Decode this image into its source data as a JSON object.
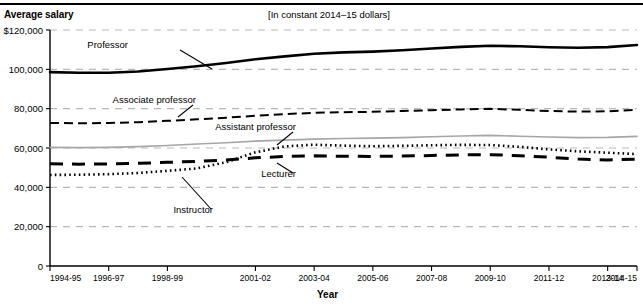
{
  "header": {
    "y_axis_title": "Average salary",
    "subtitle": "[In constant 2014–15 dollars]",
    "x_axis_title": "Year"
  },
  "chart_data": {
    "type": "line",
    "title": "Average salary",
    "subtitle": "[In constant 2014–15 dollars]",
    "xlabel": "Year",
    "ylabel": "Average salary",
    "ylim": [
      0,
      120000
    ],
    "ytick_labels": [
      "$120,000",
      "100,000",
      "80,000",
      "60,000",
      "40,000",
      "20,000",
      "0"
    ],
    "ytick_values": [
      120000,
      100000,
      80000,
      60000,
      40000,
      20000,
      0
    ],
    "grid": "horizontal-dashed",
    "legend": "inline-annotations",
    "x": [
      "1994-95",
      "1995-96",
      "1996-97",
      "1997-98",
      "1998-99",
      "1999-2000",
      "2000-01",
      "2001-02",
      "2002-03",
      "2003-04",
      "2004-05",
      "2005-06",
      "2006-07",
      "2007-08",
      "2008-09",
      "2009-10",
      "2010-11",
      "2011-12",
      "2012-13",
      "2013-14",
      "2014-15"
    ],
    "xtick_labels": [
      "1994-95",
      "1996-97",
      "1998-99",
      "2001-02",
      "2003-04",
      "2005-06",
      "2007-08",
      "2009-10",
      "2011-12",
      "2013-14",
      "2014-15"
    ],
    "xtick_indices": [
      0,
      2,
      4,
      7,
      9,
      11,
      13,
      15,
      17,
      19,
      20
    ],
    "series": [
      {
        "name": "Professor",
        "style": "solid-thick-black",
        "color": "#000000",
        "values": [
          98600,
          98300,
          98300,
          98900,
          100200,
          101600,
          103200,
          105100,
          106600,
          107900,
          108600,
          109000,
          109700,
          110600,
          111400,
          112000,
          111700,
          111200,
          111000,
          111300,
          112400
        ]
      },
      {
        "name": "Associate professor",
        "style": "dashed-black",
        "color": "#000000",
        "values": [
          72700,
          72600,
          72700,
          73100,
          73800,
          74600,
          75400,
          76400,
          77200,
          77900,
          78200,
          78400,
          78800,
          79200,
          79600,
          79900,
          79400,
          78800,
          78500,
          78700,
          79400
        ]
      },
      {
        "name": "Assistant professor",
        "style": "solid-gray",
        "color": "#a6a6a6",
        "values": [
          60300,
          60200,
          60300,
          60700,
          61300,
          62000,
          62700,
          63500,
          64000,
          64500,
          64800,
          65000,
          65300,
          65700,
          66100,
          66400,
          66000,
          65600,
          65300,
          65400,
          65900
        ]
      },
      {
        "name": "Instructor",
        "style": "dotted-black",
        "color": "#000000",
        "values": [
          46300,
          46400,
          46700,
          47300,
          48400,
          49600,
          52800,
          57800,
          60800,
          61700,
          61200,
          60900,
          61100,
          61400,
          61600,
          61500,
          60600,
          59300,
          58300,
          57600,
          56900
        ]
      },
      {
        "name": "Lecturer",
        "style": "long-dash-thick-black",
        "color": "#000000",
        "values": [
          52000,
          51800,
          51900,
          52200,
          52700,
          53200,
          53900,
          55000,
          55700,
          56000,
          55800,
          55700,
          55900,
          56200,
          56500,
          56600,
          56100,
          55300,
          54400,
          53900,
          54300
        ]
      }
    ],
    "annotations": [
      {
        "label": "Professor",
        "text_x": 128,
        "text_y": 48,
        "leader": [
          180,
          50,
          212,
          69
        ]
      },
      {
        "label": "Associate professor",
        "text_x": 196,
        "text_y": 103,
        "leader": [
          193,
          105,
          178,
          117
        ]
      },
      {
        "label": "Assistant professor",
        "text_x": 296,
        "text_y": 130,
        "leader": [
          293,
          132,
          277,
          145
        ]
      },
      {
        "label": "Lecturer",
        "text_x": 296,
        "text_y": 177,
        "leader": [
          293,
          173,
          277,
          163
        ]
      },
      {
        "label": "Instructor",
        "text_x": 213,
        "text_y": 213,
        "leader": [
          211,
          209,
          182,
          177
        ]
      }
    ]
  }
}
